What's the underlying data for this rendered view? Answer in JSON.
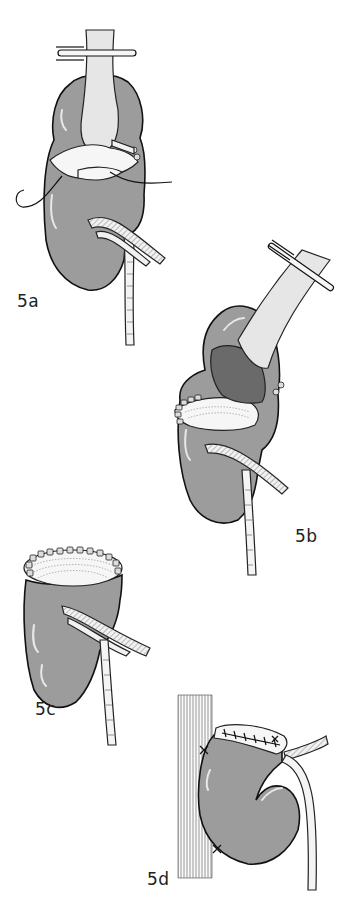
{
  "figure": {
    "panels": [
      {
        "id": "5a",
        "label": "5a",
        "description": "Kidney with clamped renal pelvis/ureter, incision being sutured, renal vessels below"
      },
      {
        "id": "5b",
        "label": "5b",
        "description": "Kidney with clamped pelvis, upper pole opened, partial suture line"
      },
      {
        "id": "5c",
        "label": "5c",
        "description": "Kidney with transected upper pole closed by interrupted sutures"
      },
      {
        "id": "5d",
        "label": "5d",
        "description": "Kidney fixed against psoas muscle with sutures"
      }
    ],
    "colors": {
      "background": "#ffffff",
      "kidney_fill": "#9c9c9c",
      "outline": "#111111",
      "label_text": "#222222"
    }
  }
}
